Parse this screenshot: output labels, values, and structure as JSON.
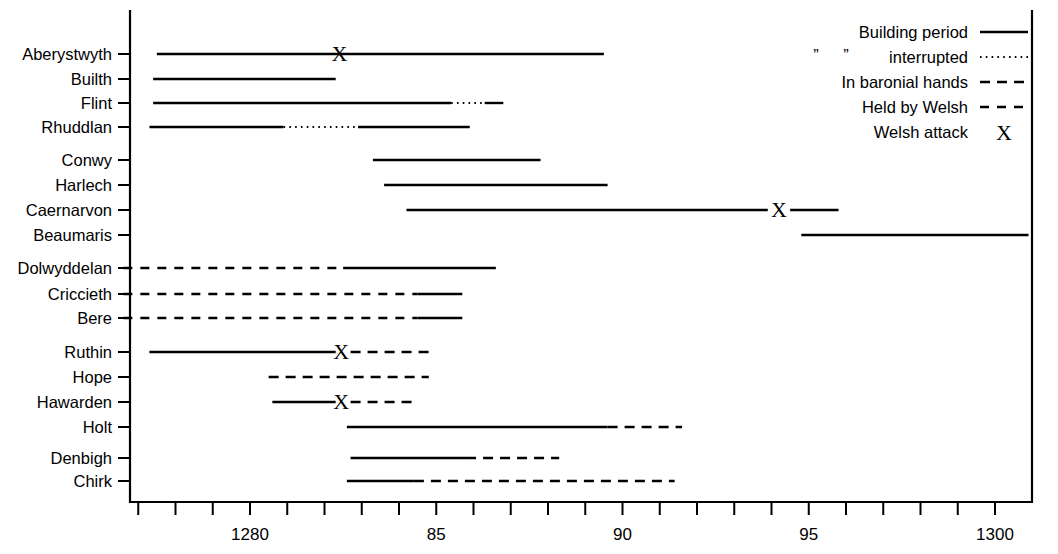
{
  "figure": {
    "background_color": "#ffffff",
    "ink_color": "#000000"
  },
  "legend": {
    "title": "",
    "position": "top-right",
    "items": [
      {
        "label": "Building period",
        "style": "solid",
        "name": "legend-building-period"
      },
      {
        "label": "interrupted",
        "style": "dotted",
        "name": "legend-interrupted",
        "quote_left": "”",
        "quote_right": "”"
      },
      {
        "label": "In baronial hands",
        "style": "dashed-long",
        "name": "legend-in-baronial-hands"
      },
      {
        "label": "Held by Welsh",
        "style": "dashed-short",
        "name": "legend-held-by-welsh"
      },
      {
        "label": "Welsh attack",
        "style": "cross",
        "name": "legend-welsh-attack",
        "glyph": "X"
      }
    ]
  },
  "axis": {
    "orientation": "horizontal",
    "label": "",
    "min_year": 1277,
    "max_year": 1301,
    "tick_step": 1,
    "labeled_ticks": [
      {
        "year": 1280,
        "label": "1280"
      },
      {
        "year": 1285,
        "label": "85"
      },
      {
        "year": 1290,
        "label": "90"
      },
      {
        "year": 1295,
        "label": "95"
      },
      {
        "year": 1300,
        "label": "1300"
      }
    ],
    "all_ticks": [
      1277,
      1278,
      1279,
      1280,
      1281,
      1282,
      1283,
      1284,
      1285,
      1286,
      1287,
      1288,
      1289,
      1290,
      1291,
      1292,
      1293,
      1294,
      1295,
      1296,
      1297,
      1298,
      1299,
      1300
    ]
  },
  "chart_data": {
    "type": "bar",
    "title": "",
    "subtitle": "",
    "xlabel": "",
    "ylabel": "",
    "xlim": [
      1276.4,
      1301.0
    ],
    "grid": false,
    "legend_position": "top-right",
    "categories": [
      "Aberystwyth",
      "Builth",
      "Flint",
      "Rhuddlan",
      "Conwy",
      "Harlech",
      "Caernarvon",
      "Beaumaris",
      "Dolwyddelan",
      "Criccieth",
      "Bere",
      "Ruthin",
      "Hope",
      "Hawarden",
      "Holt",
      "Denbigh",
      "Chirk"
    ],
    "groups": [
      {
        "name": "group-1",
        "categories": [
          "Aberystwyth",
          "Builth",
          "Flint",
          "Rhuddlan"
        ]
      },
      {
        "name": "group-2",
        "categories": [
          "Conwy",
          "Harlech",
          "Caernarvon",
          "Beaumaris"
        ]
      },
      {
        "name": "group-3",
        "categories": [
          "Dolwyddelan",
          "Criccieth",
          "Bere"
        ]
      },
      {
        "name": "group-4",
        "categories": [
          "Ruthin",
          "Hope",
          "Hawarden",
          "Holt"
        ]
      },
      {
        "name": "group-5",
        "categories": [
          "Denbigh",
          "Chirk"
        ]
      }
    ],
    "rows": [
      {
        "label": "Aberystwyth",
        "row": 0,
        "group": 0,
        "segments": [
          {
            "style": "solid",
            "start": 1277.5,
            "end": 1289.5
          }
        ],
        "attacks": [
          1282.4
        ]
      },
      {
        "label": "Builth",
        "row": 1,
        "group": 0,
        "segments": [
          {
            "style": "solid",
            "start": 1277.4,
            "end": 1282.3
          }
        ],
        "attacks": []
      },
      {
        "label": "Flint",
        "row": 2,
        "group": 0,
        "segments": [
          {
            "style": "solid",
            "start": 1277.4,
            "end": 1285.4
          },
          {
            "style": "dotted",
            "start": 1285.4,
            "end": 1286.3
          },
          {
            "style": "solid",
            "start": 1286.3,
            "end": 1286.8
          }
        ],
        "attacks": []
      },
      {
        "label": "Rhuddlan",
        "row": 3,
        "group": 0,
        "segments": [
          {
            "style": "solid",
            "start": 1277.3,
            "end": 1280.9
          },
          {
            "style": "dotted",
            "start": 1280.9,
            "end": 1282.9
          },
          {
            "style": "solid",
            "start": 1282.9,
            "end": 1285.9
          }
        ],
        "attacks": []
      },
      {
        "label": "Conwy",
        "row": 4,
        "group": 1,
        "segments": [
          {
            "style": "solid",
            "start": 1283.3,
            "end": 1287.8
          }
        ],
        "attacks": []
      },
      {
        "label": "Harlech",
        "row": 5,
        "group": 1,
        "segments": [
          {
            "style": "solid",
            "start": 1283.6,
            "end": 1289.6
          }
        ],
        "attacks": []
      },
      {
        "label": "Caernarvon",
        "row": 6,
        "group": 1,
        "segments": [
          {
            "style": "solid",
            "start": 1284.2,
            "end": 1293.9
          },
          {
            "style": "solid",
            "start": 1294.5,
            "end": 1295.8
          }
        ],
        "attacks": [
          1294.2
        ]
      },
      {
        "label": "Beaumaris",
        "row": 7,
        "group": 1,
        "segments": [
          {
            "style": "solid",
            "start": 1294.8,
            "end": 1300.9
          }
        ],
        "attacks": []
      },
      {
        "label": "Dolwyddelan",
        "row": 8,
        "group": 2,
        "segments": [
          {
            "style": "dashed-short",
            "start": 1276.6,
            "end": 1282.5
          },
          {
            "style": "solid",
            "start": 1282.5,
            "end": 1286.6
          }
        ],
        "attacks": []
      },
      {
        "label": "Criccieth",
        "row": 9,
        "group": 2,
        "segments": [
          {
            "style": "dashed-short",
            "start": 1276.6,
            "end": 1284.5
          },
          {
            "style": "solid",
            "start": 1284.5,
            "end": 1285.7
          }
        ],
        "attacks": []
      },
      {
        "label": "Bere",
        "row": 10,
        "group": 2,
        "segments": [
          {
            "style": "dashed-short",
            "start": 1276.6,
            "end": 1284.5
          },
          {
            "style": "solid",
            "start": 1284.5,
            "end": 1285.7
          }
        ],
        "attacks": []
      },
      {
        "label": "Ruthin",
        "row": 11,
        "group": 3,
        "segments": [
          {
            "style": "solid",
            "start": 1277.3,
            "end": 1282.3
          },
          {
            "style": "dashed-long",
            "start": 1282.7,
            "end": 1284.8
          }
        ],
        "attacks": [
          1282.45
        ]
      },
      {
        "label": "Hope",
        "row": 12,
        "group": 3,
        "segments": [
          {
            "style": "dashed-long",
            "start": 1280.5,
            "end": 1284.8
          }
        ],
        "attacks": []
      },
      {
        "label": "Hawarden",
        "row": 13,
        "group": 3,
        "segments": [
          {
            "style": "solid",
            "start": 1280.6,
            "end": 1282.3
          },
          {
            "style": "dashed-long",
            "start": 1282.7,
            "end": 1284.4
          }
        ],
        "attacks": [
          1282.45
        ]
      },
      {
        "label": "Holt",
        "row": 14,
        "group": 3,
        "segments": [
          {
            "style": "solid",
            "start": 1282.6,
            "end": 1289.6
          },
          {
            "style": "dashed-long",
            "start": 1289.6,
            "end": 1291.6
          }
        ],
        "attacks": []
      },
      {
        "label": "Denbigh",
        "row": 15,
        "group": 4,
        "segments": [
          {
            "style": "solid",
            "start": 1282.7,
            "end": 1285.8
          },
          {
            "style": "dashed-long",
            "start": 1285.8,
            "end": 1288.3
          }
        ],
        "attacks": []
      },
      {
        "label": "Chirk",
        "row": 16,
        "group": 4,
        "segments": [
          {
            "style": "solid",
            "start": 1282.6,
            "end": 1284.4
          },
          {
            "style": "dashed-long",
            "start": 1284.4,
            "end": 1291.4
          }
        ],
        "attacks": []
      }
    ]
  }
}
